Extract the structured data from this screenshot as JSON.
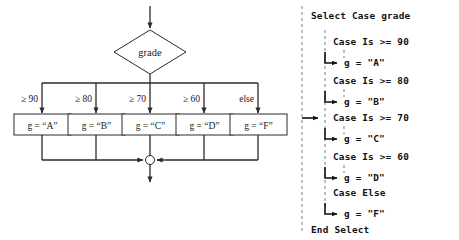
{
  "figure": {
    "flowchart": {
      "decision": {
        "label": "grade"
      },
      "branch_labels": [
        "≥ 90",
        "≥ 80",
        "≥ 70",
        "≥ 60",
        "else"
      ],
      "action_boxes": [
        {
          "label": "g = “A”"
        },
        {
          "label": "g = “B”"
        },
        {
          "label": "g = “C”"
        },
        {
          "label": "g = “D”"
        },
        {
          "label": "g = “F”"
        }
      ],
      "merge_node": "junction-circle"
    },
    "code_panel": {
      "header": "Select Case grade",
      "footer": "End Select",
      "branches": [
        {
          "case": "Case Is >= 90",
          "action": "g = \"A\""
        },
        {
          "case": "Case Is >= 80",
          "action": "g = \"B\""
        },
        {
          "case": "Case Is >= 70",
          "action": "g = \"C\""
        },
        {
          "case": "Case Is >= 60",
          "action": "g = \"D\""
        },
        {
          "case": "Case Else",
          "action": "g = \"F\""
        }
      ]
    },
    "colors": {
      "ink": "#2b2b2b",
      "code_ink": "#111111",
      "dashed_guide": "#8a8a8a",
      "background": "#ffffff"
    }
  }
}
